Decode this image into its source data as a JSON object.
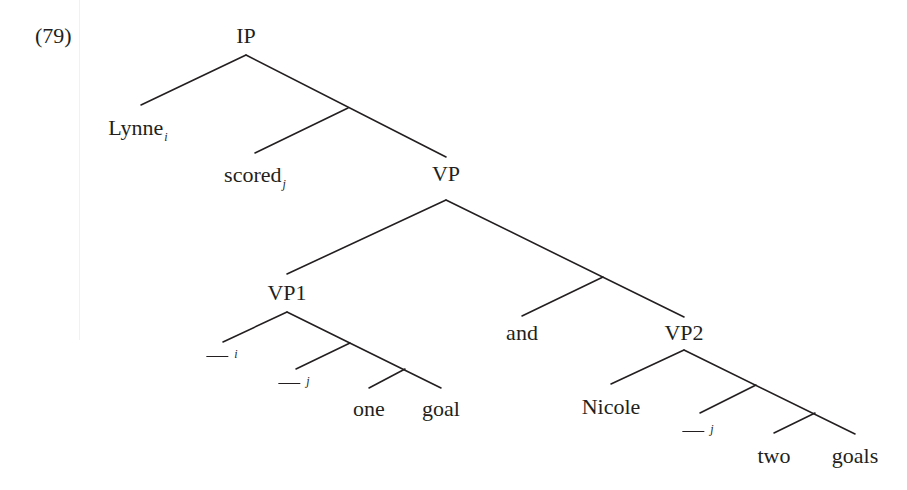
{
  "example": {
    "number": "(79)"
  },
  "tree": {
    "nodes": {
      "ip": {
        "label": "IP"
      },
      "lynne": {
        "label": "Lynne",
        "index": "i"
      },
      "scored": {
        "label": "scored",
        "index": "j"
      },
      "vp": {
        "label": "VP"
      },
      "vp1": {
        "label": "VP1"
      },
      "and": {
        "label": "and"
      },
      "vp2": {
        "label": "VP2"
      },
      "trace_i_vp1": {
        "label": "",
        "index": "i"
      },
      "trace_j_vp1": {
        "label": "",
        "index": "j"
      },
      "one": {
        "label": "one"
      },
      "goal": {
        "label": "goal"
      },
      "nicole": {
        "label": "Nicole"
      },
      "trace_j_vp2": {
        "label": "",
        "index": "j"
      },
      "two": {
        "label": "two"
      },
      "goals": {
        "label": "goals"
      }
    },
    "structure": [
      [
        "IP",
        [
          "Lynne_i",
          [
            "scored_j",
            "VP"
          ]
        ]
      ],
      [
        "VP",
        [
          "VP1",
          [
            "and",
            "VP2"
          ]
        ]
      ],
      [
        "VP1",
        [
          "__i",
          [
            "__j",
            [
              "one",
              "goal"
            ]
          ]
        ]
      ],
      [
        "VP2",
        [
          "Nicole",
          [
            "__j",
            [
              "two",
              "goals"
            ]
          ]
        ]
      ]
    ]
  }
}
